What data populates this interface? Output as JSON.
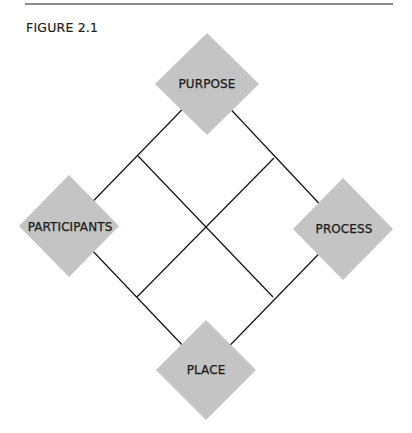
{
  "figure": {
    "label": "FIGURE 2.1"
  },
  "colors": {
    "diamond_fill": "#c4c4c4",
    "line": "#1a1a1a",
    "rule": "#8c8c8c",
    "text": "#1a1a1a"
  },
  "nodes": [
    {
      "id": "purpose",
      "label": "PURPOSE",
      "position": "top"
    },
    {
      "id": "participants",
      "label": "PARTICIPANTS",
      "position": "left"
    },
    {
      "id": "process",
      "label": "PROCESS",
      "position": "right"
    },
    {
      "id": "place",
      "label": "PLACE",
      "position": "bottom"
    }
  ],
  "edges": [
    {
      "from": "purpose",
      "to": "participants"
    },
    {
      "from": "purpose",
      "to": "process"
    },
    {
      "from": "participants",
      "to": "place"
    },
    {
      "from": "process",
      "to": "place"
    },
    {
      "from": "purpose-participants-midpoint",
      "to": "process-place-midpoint"
    },
    {
      "from": "purpose-process-midpoint",
      "to": "participants-place-midpoint"
    }
  ]
}
